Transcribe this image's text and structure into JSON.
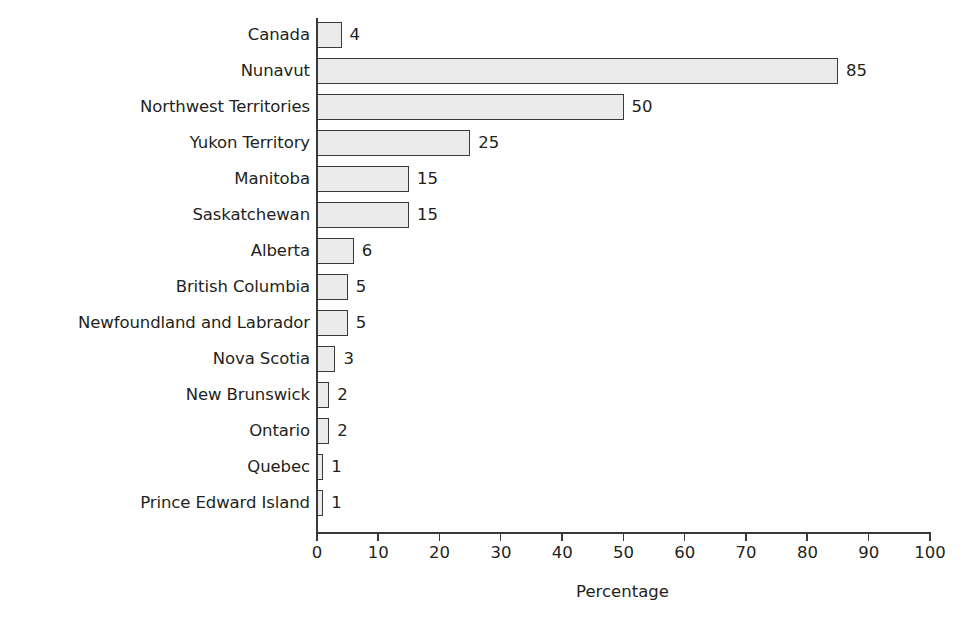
{
  "chart_data": {
    "type": "bar",
    "orientation": "horizontal",
    "title": "",
    "subtitle": "",
    "xlabel": "Percentage",
    "ylabel": "",
    "xlim": [
      0,
      100
    ],
    "xticks": [
      0,
      10,
      20,
      30,
      40,
      50,
      60,
      70,
      80,
      90,
      100
    ],
    "xtick_labels": [
      "0",
      "10",
      "20",
      "30",
      "40",
      "50",
      "60",
      "70",
      "80",
      "90",
      "100"
    ],
    "grid": false,
    "legend": false,
    "legend_position": "none",
    "bar_fill_color": "#ebebeb",
    "bar_border_color": "#3a3a3a",
    "axis_color": "#3a3a3a",
    "text_color": "#231f20",
    "background_color": "#ffffff",
    "value_labels_shown": true,
    "categories": [
      "Canada",
      "Nunavut",
      "Northwest Territories",
      "Yukon Territory",
      "Manitoba",
      "Saskatchewan",
      "Alberta",
      "British Columbia",
      "Newfoundland and Labrador",
      "Nova Scotia",
      "New Brunswick",
      "Ontario",
      "Quebec",
      "Prince Edward Island"
    ],
    "values": [
      4,
      85,
      50,
      25,
      15,
      15,
      6,
      5,
      5,
      3,
      2,
      2,
      1,
      1
    ],
    "value_label_texts": [
      "4",
      "85",
      "50",
      "25",
      "15",
      "15",
      "6",
      "5",
      "5",
      "3",
      "2",
      "2",
      "1",
      "1"
    ],
    "bars": [
      {
        "category": "Canada",
        "value": 4,
        "label": "4"
      },
      {
        "category": "Nunavut",
        "value": 85,
        "label": "85"
      },
      {
        "category": "Northwest Territories",
        "value": 50,
        "label": "50"
      },
      {
        "category": "Yukon Territory",
        "value": 25,
        "label": "25"
      },
      {
        "category": "Manitoba",
        "value": 15,
        "label": "15"
      },
      {
        "category": "Saskatchewan",
        "value": 15,
        "label": "15"
      },
      {
        "category": "Alberta",
        "value": 6,
        "label": "6"
      },
      {
        "category": "British Columbia",
        "value": 5,
        "label": "5"
      },
      {
        "category": "Newfoundland and Labrador",
        "value": 5,
        "label": "5"
      },
      {
        "category": "Nova Scotia",
        "value": 3,
        "label": "3"
      },
      {
        "category": "New Brunswick",
        "value": 2,
        "label": "2"
      },
      {
        "category": "Ontario",
        "value": 2,
        "label": "2"
      },
      {
        "category": "Quebec",
        "value": 1,
        "label": "1"
      },
      {
        "category": "Prince Edward Island",
        "value": 1,
        "label": "1"
      }
    ]
  },
  "layout": {
    "axis_origin_x": 317,
    "axis_baseline_y": 532,
    "px_per_unit": 6.13,
    "row_pitch": 36,
    "row_top": 17,
    "bar_height": 26
  }
}
